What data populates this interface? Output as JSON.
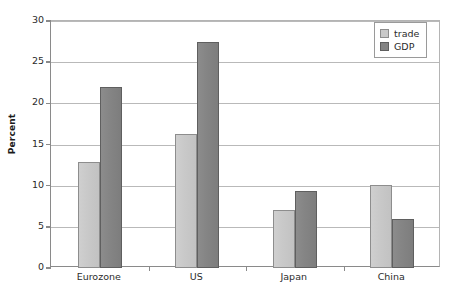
{
  "chart_data": {
    "type": "bar",
    "title": "",
    "xlabel": "",
    "ylabel": "Percent",
    "categories": [
      "Eurozone",
      "US",
      "Japan",
      "China"
    ],
    "series": [
      {
        "name": "trade",
        "color": "#c9c9c9",
        "values": [
          12.9,
          16.3,
          7.0,
          10.1
        ]
      },
      {
        "name": "GDP",
        "color": "#848484",
        "values": [
          22.0,
          27.5,
          9.4,
          6.0
        ]
      }
    ],
    "ylim": [
      0,
      30
    ],
    "ytick_values": [
      0,
      5,
      10,
      15,
      20,
      25,
      30
    ],
    "ytick_labels": [
      "0",
      "5",
      "10",
      "15",
      "20",
      "25",
      "30"
    ],
    "grid": true,
    "legend_position": "top-right",
    "legend_entries": [
      "trade",
      "GDP"
    ]
  },
  "axis": {
    "y_title": "Percent"
  }
}
